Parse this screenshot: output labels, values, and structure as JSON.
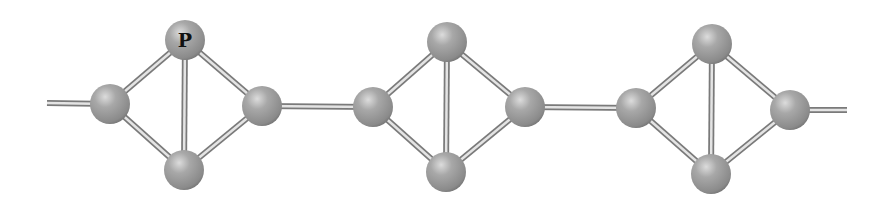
{
  "diagram": {
    "title": "",
    "colors": {
      "atom": "#9a9a9a",
      "atom_highlight": "#d6d6d6",
      "atom_shadow": "#6e6e6e",
      "bond": "#b5b5b5",
      "bond_edge": "#7a7a7a",
      "label": "#111111"
    },
    "atom_radius": 20,
    "labels": [
      {
        "atom": "u1_top",
        "text": "P"
      }
    ],
    "atoms": [
      {
        "id": "u1_left",
        "x": 110,
        "y": 104
      },
      {
        "id": "u1_top",
        "x": 185,
        "y": 40
      },
      {
        "id": "u1_right",
        "x": 262,
        "y": 106
      },
      {
        "id": "u1_bottom",
        "x": 184,
        "y": 170
      },
      {
        "id": "u2_left",
        "x": 373,
        "y": 107
      },
      {
        "id": "u2_top",
        "x": 447,
        "y": 42
      },
      {
        "id": "u2_right",
        "x": 525,
        "y": 107
      },
      {
        "id": "u2_bottom",
        "x": 446,
        "y": 172
      },
      {
        "id": "u3_left",
        "x": 636,
        "y": 108
      },
      {
        "id": "u3_top",
        "x": 712,
        "y": 44
      },
      {
        "id": "u3_right",
        "x": 790,
        "y": 110
      },
      {
        "id": "u3_bottom",
        "x": 711,
        "y": 174
      }
    ],
    "bonds": [
      [
        "start",
        "u1_left"
      ],
      [
        "u1_left",
        "u1_top"
      ],
      [
        "u1_left",
        "u1_bottom"
      ],
      [
        "u1_top",
        "u1_bottom"
      ],
      [
        "u1_top",
        "u1_right"
      ],
      [
        "u1_bottom",
        "u1_right"
      ],
      [
        "u1_right",
        "u2_left"
      ],
      [
        "u2_left",
        "u2_top"
      ],
      [
        "u2_left",
        "u2_bottom"
      ],
      [
        "u2_top",
        "u2_bottom"
      ],
      [
        "u2_top",
        "u2_right"
      ],
      [
        "u2_bottom",
        "u2_right"
      ],
      [
        "u2_right",
        "u3_left"
      ],
      [
        "u3_left",
        "u3_top"
      ],
      [
        "u3_left",
        "u3_bottom"
      ],
      [
        "u3_top",
        "u3_bottom"
      ],
      [
        "u3_top",
        "u3_right"
      ],
      [
        "u3_bottom",
        "u3_right"
      ],
      [
        "u3_right",
        "end"
      ]
    ],
    "chain_ends": {
      "start": {
        "x": 47,
        "y": 103
      },
      "end": {
        "x": 847,
        "y": 110
      }
    }
  }
}
